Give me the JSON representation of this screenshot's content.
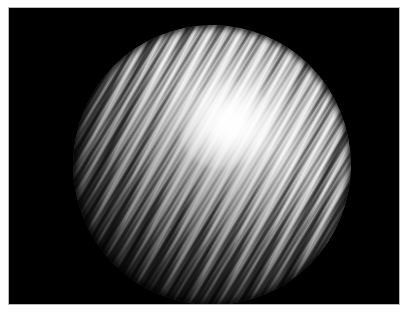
{
  "image": {
    "title": "Striped metallic sphere render",
    "subject": "sphere",
    "background_color": "#000000",
    "mat_color": "#ffffff",
    "border_color": "#b9b9b9",
    "width": 412,
    "height": 323
  },
  "canvas": {
    "x": 9,
    "y": 8,
    "width": 390,
    "height": 296,
    "color": "#000000"
  },
  "sphere": {
    "label": "sphere",
    "center_x": 212,
    "center_y": 165,
    "radius_x": 139,
    "radius_y": 140,
    "surface": "brushed anisotropic stripes",
    "stripe_angle_deg": 118,
    "stripe_count": 46,
    "highlight_color": "#ffffff",
    "shadow_color": "#050505",
    "midtone_color": "#8e8e8e"
  },
  "highlight": {
    "label": "specular highlight",
    "center_x": 225,
    "center_y": 125,
    "color": "#ffffff",
    "intensity": "blown-out"
  },
  "palette": {
    "white": "#ffffff",
    "black": "#000000",
    "frame": "#b9b9b9",
    "light_grey": "#d8d8d8",
    "mid_grey": "#8e8e8e",
    "dark_grey": "#2a2a2a"
  }
}
